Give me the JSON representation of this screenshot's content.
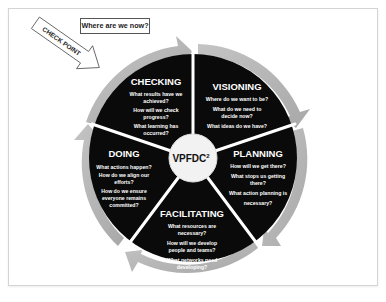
{
  "diagram": {
    "type": "cycle-wheel",
    "center": {
      "label": "VPFDC",
      "superscript": "2"
    },
    "callouts": {
      "where_label": "Where are we now?",
      "checkpoint_label": "CHECK POINT"
    },
    "segments": [
      {
        "title": "CHECKING",
        "questions": [
          "What results have we",
          "achieved?",
          "How will we check",
          "progress?",
          "What learning has",
          "occurred?"
        ]
      },
      {
        "title": "VISIONING",
        "questions": [
          "Where do we want to be?",
          "What do we need to",
          "decide now?",
          "What ideas do we have?"
        ]
      },
      {
        "title": "PLANNING",
        "questions": [
          "How will we get  there?",
          "What stops us getting",
          "there?",
          "What action planning is",
          "necessary?"
        ]
      },
      {
        "title": "FACILITATING",
        "questions": [
          "What resources are",
          "necessary?",
          "How will we develop",
          "people and teams?",
          "What networks need",
          "developing?"
        ]
      },
      {
        "title": "DOING",
        "questions": [
          "What actions happen?",
          "How do we align our",
          "efforts?",
          "How do we ensure",
          "everyone remains",
          "committed?"
        ]
      }
    ],
    "colors": {
      "segment_fill": "#0a0a0a",
      "arrow_ring": "#b3b3b3",
      "divider": "#ffffff",
      "center_fill": "#f2f2f2",
      "frame_border": "#d4d4d4"
    }
  }
}
